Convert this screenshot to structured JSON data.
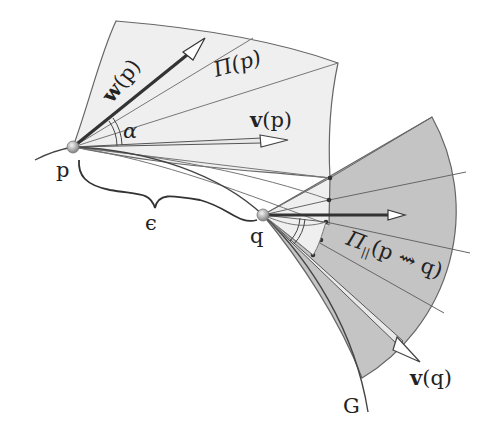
{
  "diagram": {
    "type": "geometric-illustration",
    "colors": {
      "plane_p_fill": "#efefef",
      "plane_q_fill": "#c4c4c4",
      "line": "#555555",
      "vector_dark": "#333333",
      "point": "#9a9a9a"
    },
    "points": [
      {
        "id": "p",
        "label": "p",
        "x": 73,
        "y": 147
      },
      {
        "id": "q",
        "label": "q",
        "x": 263,
        "y": 215
      }
    ],
    "labels": {
      "w_p_bold": "w",
      "w_p_arg": "(p)",
      "pi_p": "Π(p)",
      "v_p_bold": "v",
      "v_p_arg": "(p)",
      "alpha": "α",
      "p": "p",
      "epsilon": "ϵ",
      "q": "q",
      "pi_parallel_main": "Π",
      "pi_parallel_sub": "||",
      "pi_parallel_arg": "(p ⇝ q)",
      "v_q_bold": "v",
      "v_q_arg": "(q)",
      "G": "G"
    }
  }
}
